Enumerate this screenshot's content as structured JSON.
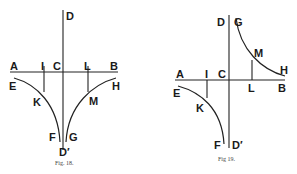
{
  "figures": [
    {
      "id": "fig18",
      "caption": "Fig. 18.",
      "description": "Two hyperbola branches below axis AB, both asymptotic to DD'",
      "labels": {
        "A": "A",
        "B": "B",
        "C": "C",
        "D": "D",
        "D_prime": "D′",
        "E": "E",
        "F": "F",
        "G": "G",
        "H": "H",
        "I": "I",
        "K": "K",
        "L": "L",
        "M": "M"
      }
    },
    {
      "id": "fig19",
      "caption": "Fig 19.",
      "description": "Conjugate hyperbola branches in opposite quadrants, asymptotic to AB and DD'",
      "labels": {
        "A": "A",
        "B": "B",
        "C": "C",
        "D": "D",
        "D_prime": "D′",
        "E": "E",
        "F": "F",
        "G": "G",
        "H": "H",
        "I": "I",
        "K": "K",
        "L": "L",
        "M": "M"
      }
    }
  ],
  "colors": {
    "ink": "#222222",
    "background": "#ffffff"
  }
}
